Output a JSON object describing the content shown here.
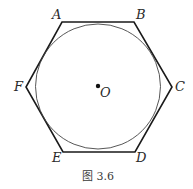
{
  "figure": {
    "caption": "图 3.6",
    "center_label": "O",
    "vertices": [
      {
        "label": "A",
        "x": 62,
        "y": 22,
        "lx": 51,
        "ly": 19
      },
      {
        "label": "B",
        "x": 134,
        "y": 22,
        "lx": 137,
        "ly": 19
      },
      {
        "label": "C",
        "x": 172,
        "y": 87,
        "lx": 175,
        "ly": 91
      },
      {
        "label": "D",
        "x": 135,
        "y": 152,
        "lx": 136,
        "ly": 162
      },
      {
        "label": "E",
        "x": 63,
        "y": 152,
        "lx": 52,
        "ly": 162
      },
      {
        "label": "F",
        "x": 26,
        "y": 87,
        "lx": 14,
        "ly": 91
      }
    ],
    "center": {
      "x": 98,
      "y": 86
    },
    "radius": 63,
    "stroke_color": "#1a1a1a",
    "circle_color": "#444444"
  }
}
